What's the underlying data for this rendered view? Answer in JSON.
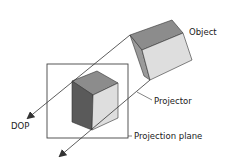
{
  "diagram": {
    "labels": {
      "object": "Object",
      "projector": "Projector",
      "dop": "DOP",
      "projection_plane": "Projection plane"
    },
    "colors": {
      "stroke": "#333333",
      "top_face": "#8c8c8c",
      "light_face": "#dedede",
      "dark_face": "#5a5a5a",
      "side_face": "#9a9a9a"
    }
  }
}
